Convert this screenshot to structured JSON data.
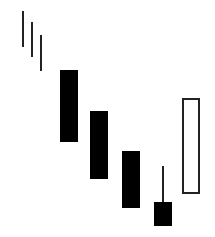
{
  "diagram": {
    "type": "candlestick-pattern",
    "background": "#ffffff",
    "stroke_color": "#222222",
    "fill_bearish": "#000000",
    "fill_bullish": "#ffffff",
    "trend_lines": [
      {
        "x": 23,
        "y1": 11,
        "y2": 47
      },
      {
        "x": 32,
        "y1": 22,
        "y2": 57
      },
      {
        "x": 41,
        "y1": 35,
        "y2": 71
      }
    ],
    "candles": [
      {
        "kind": "bearish",
        "x": 60,
        "w": 18,
        "body_top": 70,
        "body_bottom": 142,
        "wick_top": null,
        "wick_bottom": null
      },
      {
        "kind": "bearish",
        "x": 90,
        "w": 18,
        "body_top": 111,
        "body_bottom": 179,
        "wick_top": null,
        "wick_bottom": null
      },
      {
        "kind": "bearish",
        "x": 122,
        "w": 18,
        "body_top": 151,
        "body_bottom": 208,
        "wick_top": null,
        "wick_bottom": null
      },
      {
        "kind": "bearish",
        "x": 154,
        "w": 18,
        "body_top": 202,
        "body_bottom": 226,
        "wick_top": 166,
        "wick_bottom": null
      },
      {
        "kind": "bullish",
        "x": 182,
        "w": 18,
        "body_top": 98,
        "body_bottom": 194,
        "wick_top": null,
        "wick_bottom": null
      }
    ]
  }
}
